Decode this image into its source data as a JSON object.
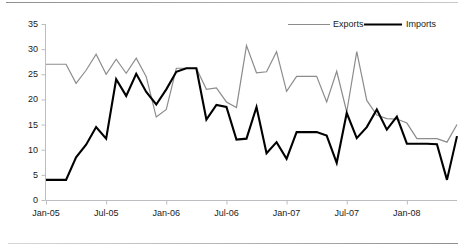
{
  "chart_data": {
    "type": "line",
    "title": "",
    "xlabel": "",
    "ylabel": "",
    "ylim": [
      0,
      35
    ],
    "ytick_values": [
      0,
      5,
      10,
      15,
      20,
      25,
      30,
      35
    ],
    "ytick_labels": [
      "0",
      "5",
      "10",
      "15",
      "20",
      "25",
      "30",
      "35"
    ],
    "grid": false,
    "legend_position": "top-right",
    "x_tick_labels": [
      "Jan-05",
      "Jul-05",
      "Jan-06",
      "Jul-06",
      "Jan-07",
      "Jul-07",
      "Jan-08"
    ],
    "x_tick_indices": [
      0,
      6,
      12,
      18,
      24,
      30,
      36
    ],
    "x_count": 42,
    "series": [
      {
        "name": "Exports",
        "color": "#8c8c8c",
        "width": 1.2,
        "values": [
          27.0,
          27.0,
          27.0,
          23.2,
          25.8,
          29.0,
          25.0,
          28.0,
          25.2,
          28.2,
          24.5,
          16.5,
          18.0,
          26.2,
          26.2,
          26.2,
          22.0,
          22.3,
          19.5,
          18.4,
          30.7,
          25.3,
          25.5,
          29.5,
          21.6,
          24.6,
          24.6,
          24.6,
          19.5,
          25.6,
          17.5,
          29.5,
          19.8,
          16.9,
          16.2,
          16.1,
          15.3,
          12.2,
          12.2,
          12.2,
          11.5,
          15.0
        ]
      },
      {
        "name": "Imports",
        "color": "#000000",
        "width": 2.1,
        "values": [
          4.0,
          4.0,
          4.0,
          8.5,
          11.0,
          14.5,
          12.2,
          24.0,
          20.7,
          25.1,
          21.5,
          19.0,
          22.0,
          25.5,
          26.2,
          26.2,
          16.0,
          18.9,
          18.5,
          12.0,
          12.2,
          18.5,
          9.3,
          11.5,
          8.2,
          13.5,
          13.5,
          13.5,
          12.8,
          7.4,
          17.3,
          12.3,
          14.5,
          18.0,
          14.0,
          16.6,
          11.2,
          11.2,
          11.2,
          11.1,
          4.0,
          12.7
        ]
      }
    ]
  },
  "legend": {
    "items": [
      {
        "label": "Exports",
        "key": "exports"
      },
      {
        "label": "Imports",
        "key": "imports"
      }
    ]
  },
  "axes": {
    "y_axis_name": "value-axis",
    "x_axis_name": "time-axis"
  }
}
